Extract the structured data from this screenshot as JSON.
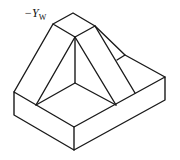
{
  "diagram": {
    "axis_label": "−Y",
    "axis_label_sub": "W",
    "stroke_color": "#1a1a1a",
    "background": "#ffffff"
  }
}
